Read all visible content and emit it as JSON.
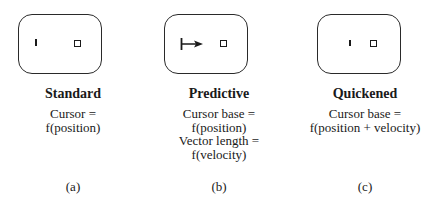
{
  "panels": [
    {
      "id": "a",
      "title": "Standard",
      "description": [
        "Cursor =",
        "f(position)"
      ],
      "label": "(a)",
      "cursor_type": "tick-mark"
    },
    {
      "id": "b",
      "title": "Predictive",
      "description": [
        "Cursor base =",
        "f(position)",
        "Vector length =",
        "f(velocity)"
      ],
      "label": "(b)",
      "cursor_type": "vector-arrow"
    },
    {
      "id": "c",
      "title": "Quickened",
      "description": [
        "Cursor base =",
        "f(position + velocity)"
      ],
      "label": "(c)",
      "cursor_type": "tick-mark"
    }
  ],
  "colors": {
    "stroke": "#1a1a1a",
    "background": "#ffffff"
  }
}
